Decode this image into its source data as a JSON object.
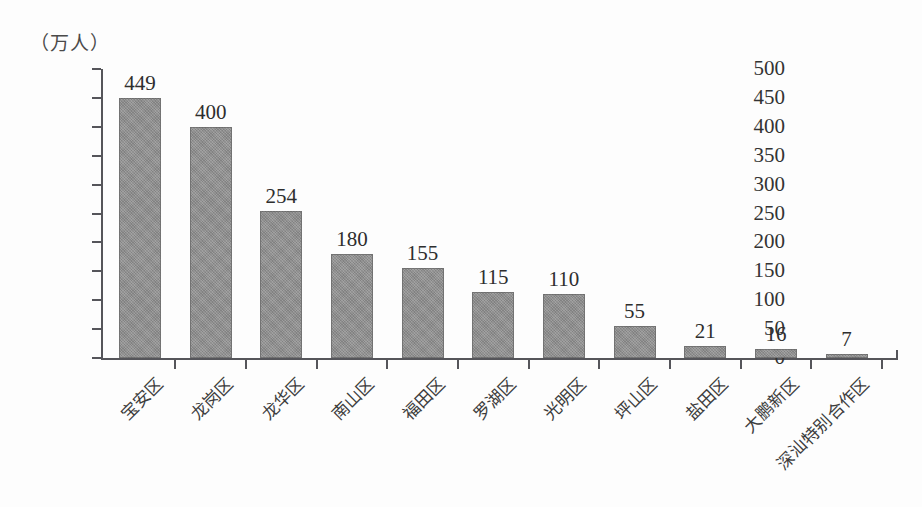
{
  "unit_caption": "（万人）",
  "chart_data": {
    "type": "bar",
    "title": "",
    "subtitle": "",
    "xlabel": "",
    "ylabel": "（万人）",
    "ylim": [
      0,
      500
    ],
    "ytick_step": 50,
    "yticks": [
      "500",
      "450",
      "400",
      "350",
      "300",
      "250",
      "200",
      "150",
      "100",
      "50",
      "0"
    ],
    "grid": false,
    "legend": "none",
    "bar_color": "#8e8e8e",
    "axis_color": "#55555a",
    "categories": [
      "宝安区",
      "龙岗区",
      "龙华区",
      "南山区",
      "福田区",
      "罗湖区",
      "光明区",
      "坪山区",
      "盐田区",
      "大鹏新区",
      "深汕特别合作区"
    ],
    "values": [
      449,
      400,
      254,
      180,
      155,
      115,
      110,
      55,
      21,
      16,
      7
    ],
    "value_labels": [
      "449",
      "400",
      "254",
      "180",
      "155",
      "115",
      "110",
      "55",
      "21",
      "16",
      "7"
    ]
  }
}
